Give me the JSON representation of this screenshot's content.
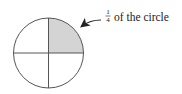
{
  "diagram": {
    "circle": {
      "cx": 48.5,
      "cy": 53,
      "r": 35,
      "stroke": "#555555",
      "shaded_fill": "#d4d4d4"
    },
    "shaded_quadrant": "top-right",
    "label": {
      "fraction_numerator": "1",
      "fraction_denominator": "4",
      "text": "of the circle"
    }
  }
}
